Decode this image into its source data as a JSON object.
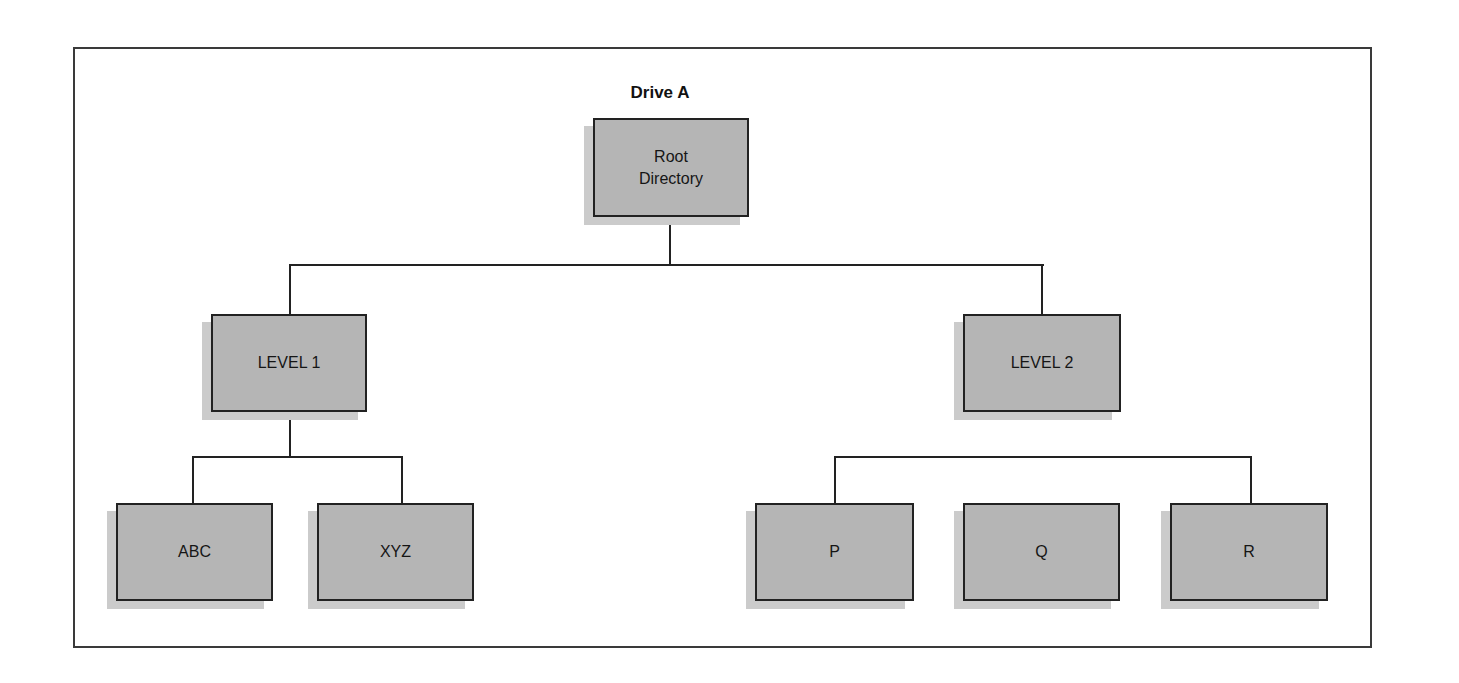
{
  "diagram": {
    "title": "Drive A",
    "type": "directory-tree",
    "nodes": {
      "root": {
        "line1": "Root",
        "line2": "Directory"
      },
      "level1": {
        "label": "LEVEL 1"
      },
      "level2": {
        "label": "LEVEL 2"
      },
      "abc": {
        "label": "ABC"
      },
      "xyz": {
        "label": "XYZ"
      },
      "p": {
        "label": "P"
      },
      "q": {
        "label": "Q"
      },
      "r": {
        "label": "R"
      }
    },
    "edges": [
      [
        "Root Directory",
        "LEVEL 1"
      ],
      [
        "Root Directory",
        "LEVEL 2"
      ],
      [
        "LEVEL 1",
        "ABC"
      ],
      [
        "LEVEL 1",
        "XYZ"
      ],
      [
        "bracket",
        "P"
      ],
      [
        "bracket",
        "R"
      ]
    ],
    "colors": {
      "node_fill": "#b5b5b5",
      "node_shadow": "#cbcbcb",
      "line": "#222222",
      "frame": "#3a3a3a",
      "background": "#ffffff"
    }
  }
}
